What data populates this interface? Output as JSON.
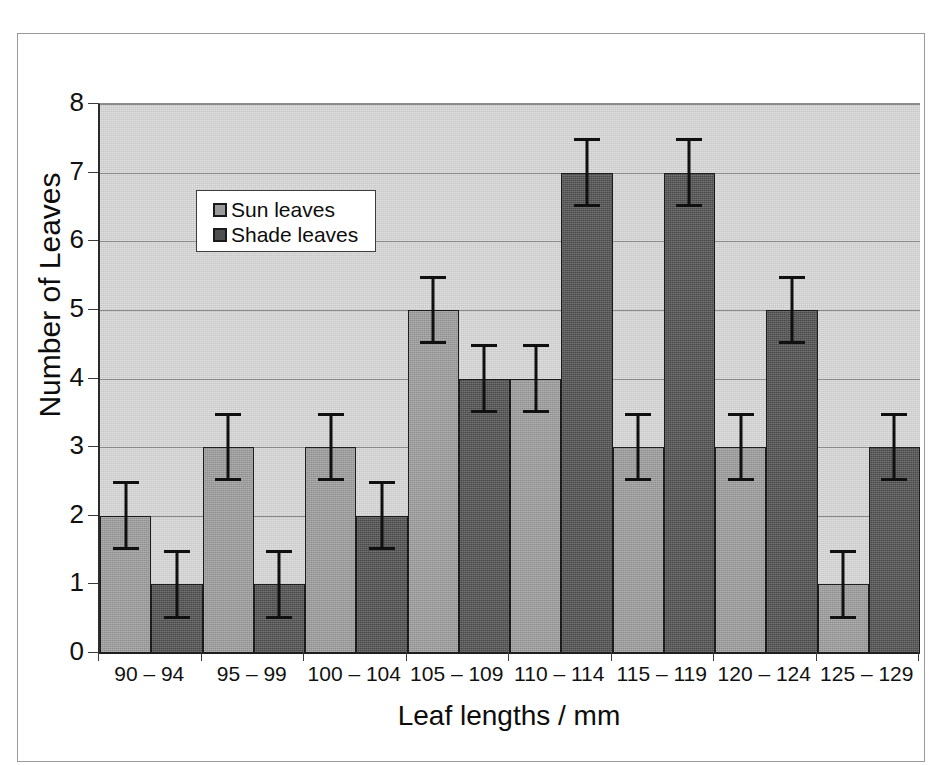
{
  "chart_data": {
    "type": "bar",
    "title": "",
    "xlabel": "Leaf lengths / mm",
    "ylabel": "Number of Leaves",
    "categories": [
      "90 – 94",
      "95 – 99",
      "100 – 104",
      "105 – 109",
      "110 – 114",
      "115 – 119",
      "120 – 124",
      "125 – 129"
    ],
    "series": [
      {
        "name": "Sun leaves",
        "color": "#9b9b9b",
        "values": [
          2,
          3,
          3,
          5,
          4,
          3,
          3,
          1
        ],
        "errors": [
          0.5,
          0.5,
          0.5,
          0.5,
          0.5,
          0.5,
          0.5,
          0.5
        ]
      },
      {
        "name": "Shade leaves",
        "color": "#4f4f4f",
        "values": [
          1,
          1,
          2,
          4,
          7,
          7,
          5,
          3
        ],
        "errors": [
          0.5,
          0.5,
          0.5,
          0.5,
          0.5,
          0.5,
          0.5,
          0.5
        ]
      }
    ],
    "ylim": [
      0,
      8
    ],
    "yticks": [
      0,
      1,
      2,
      3,
      4,
      5,
      6,
      7,
      8
    ],
    "ytick_labels": [
      "0",
      "1",
      "2",
      "3",
      "4",
      "5",
      "6",
      "7",
      "8"
    ],
    "grid": true,
    "grid_axis": "y",
    "legend_position": "upper-left-inside",
    "plot_background": "#d2d2d2",
    "error_bar_style": "capped, ±0.5"
  },
  "legend": {
    "entries": [
      {
        "label": "Sun leaves"
      },
      {
        "label": "Shade leaves"
      }
    ]
  },
  "axes": {
    "y_title": "Number of Leaves",
    "x_title": "Leaf lengths / mm"
  }
}
